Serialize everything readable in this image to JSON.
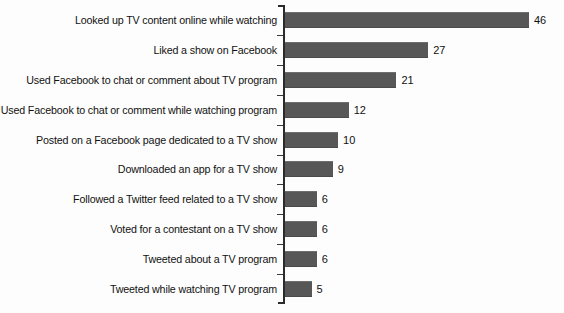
{
  "chart_data": {
    "type": "bar",
    "orientation": "horizontal",
    "title": "",
    "subtitle": "",
    "xlabel": "",
    "ylabel": "",
    "grid": false,
    "legend": null,
    "xlim": [
      0,
      46
    ],
    "value_labels_shown": true,
    "categories": [
      "Looked up TV content online while watching",
      "Liked a show on Facebook",
      "Used Facebook to chat or comment about TV program",
      "Used Facebook to chat or comment while watching program",
      "Posted on a Facebook page dedicated to a TV show",
      "Downloaded an app for a TV show",
      "Followed a Twitter feed related to a TV show",
      "Voted for a contestant on a TV show",
      "Tweeted about a TV program",
      "Tweeted while watching TV program"
    ],
    "values": [
      46,
      27,
      21,
      12,
      10,
      9,
      6,
      6,
      6,
      5
    ],
    "value_text": [
      "46",
      "27",
      "21",
      "12",
      "10",
      "9",
      "6",
      "6",
      "6",
      "5"
    ],
    "colors": {
      "bar": "#575757",
      "axis": "#2b2b2b",
      "text": "#111111",
      "background": "#fdfdfd"
    }
  }
}
